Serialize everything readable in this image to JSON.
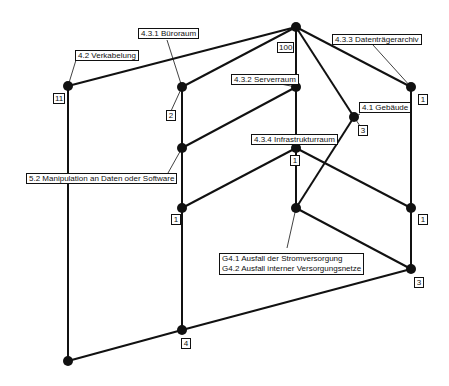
{
  "diagram": {
    "type": "lattice",
    "nodes": [
      {
        "id": "top",
        "x": 296,
        "y": 27,
        "count": "100"
      },
      {
        "id": "verkabelung",
        "x": 68,
        "y": 86,
        "label": "4.2 Verkabelung",
        "count": "11"
      },
      {
        "id": "bueroraum",
        "x": 182,
        "y": 87,
        "label": "4.3.1 Büroraum",
        "count": "2"
      },
      {
        "id": "serverraum",
        "x": 296,
        "y": 87,
        "label": "4.3.2 Serverraum"
      },
      {
        "id": "datentraegerarchiv",
        "x": 411,
        "y": 87,
        "label": "4.3.3 Datenträgerarchiv",
        "count": "1"
      },
      {
        "id": "gebaeude",
        "x": 354,
        "y": 117,
        "label": "4.1 Gebäude",
        "count": "3"
      },
      {
        "id": "manipulation",
        "x": 182,
        "y": 148,
        "label": "5.2 Manipulation an Daten oder Software"
      },
      {
        "id": "infrastrukturraum",
        "x": 296,
        "y": 148,
        "label": "4.3.4 Infrastrukturraum",
        "count": "1"
      },
      {
        "id": "left-mid",
        "x": 182,
        "y": 208,
        "count": "1"
      },
      {
        "id": "center-low",
        "x": 296,
        "y": 208
      },
      {
        "id": "right-mid",
        "x": 411,
        "y": 208,
        "count": "1"
      },
      {
        "id": "right-low",
        "x": 411,
        "y": 269,
        "label": "G4.1 Ausfall der Stromversorgung / G4.2 Ausfall interner Versorgungsnetze",
        "count": "3"
      },
      {
        "id": "bottom-center",
        "x": 182,
        "y": 330,
        "count": "4"
      },
      {
        "id": "bottom",
        "x": 68,
        "y": 361
      }
    ],
    "labels": {
      "verkabelung": "4.2 Verkabelung",
      "bueroraum": "4.3.1 Büroraum",
      "serverraum": "4.3.2 Serverraum",
      "datentraegerarchiv": "4.3.3 Datenträgerarchiv",
      "gebaeude": "4.1 Gebäude",
      "manipulation": "5.2 Manipulation an Daten oder Software",
      "infrastrukturraum": "4.3.4 Infrastrukturraum",
      "ausfall_line1": "G4.1 Ausfall der Stromversorgung",
      "ausfall_line2": "G4.2 Ausfall interner Versorgungsnetze"
    },
    "counts": {
      "top": "100",
      "verkabelung": "11",
      "bueroraum": "2",
      "datentraegerarchiv": "1",
      "gebaeude": "3",
      "infrastrukturraum": "1",
      "left_mid": "1",
      "right_mid": "1",
      "right_low": "3",
      "bottom_center": "4"
    }
  }
}
